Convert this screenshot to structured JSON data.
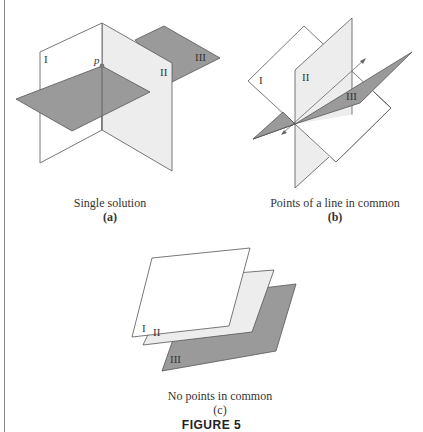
{
  "figure": {
    "title": "FIGURE 5",
    "colors": {
      "white_plane": "#ffffff",
      "light_plane": "#ededed",
      "dark_plane": "#9a9a9a",
      "stroke": "#555555",
      "point": "#777777"
    },
    "panels": [
      {
        "id": "a",
        "caption": "Single solution",
        "sub_label": "(a)",
        "plane_labels": [
          "I",
          "II",
          "III"
        ],
        "point_label": "p"
      },
      {
        "id": "b",
        "caption": "Points of a line in common",
        "sub_label": "(b)",
        "plane_labels": [
          "I",
          "II",
          "III"
        ]
      },
      {
        "id": "c",
        "caption": "No points in common",
        "sub_label": "(c)",
        "plane_labels": [
          "I",
          "II",
          "III"
        ]
      }
    ]
  }
}
